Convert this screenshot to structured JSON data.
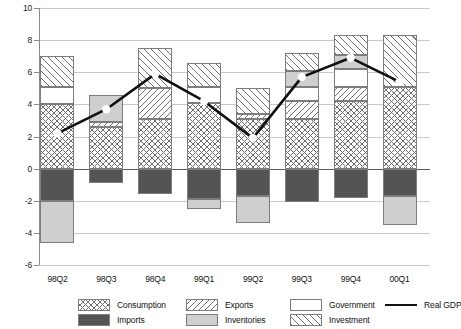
{
  "chart_data": {
    "type": "bar",
    "subtype": "stacked-bar-with-line-overlay",
    "title": "",
    "xlabel": "",
    "ylabel": "",
    "ylim": [
      -6,
      10
    ],
    "yticks": [
      -6,
      -4,
      -2,
      0,
      2,
      4,
      6,
      8,
      10
    ],
    "ytick_labels": [
      "-6",
      "-4",
      "-2",
      "0",
      "2",
      "4",
      "6",
      "8",
      "10"
    ],
    "grid": true,
    "legend_position": "bottom",
    "categories": [
      "98Q2",
      "98Q3",
      "98Q4",
      "99Q1",
      "99Q2",
      "99Q3",
      "99Q4",
      "00Q1"
    ],
    "series": [
      {
        "name": "Consumption",
        "pattern": "cross-hatch",
        "values": [
          4.0,
          2.6,
          3.1,
          4.1,
          3.1,
          3.1,
          4.2,
          5.1
        ]
      },
      {
        "name": "Exports",
        "pattern": "diagonal-backslash",
        "values": [
          0.0,
          0.3,
          1.9,
          0.0,
          0.3,
          1.1,
          0.9,
          0.0
        ]
      },
      {
        "name": "Government",
        "pattern": "blank-white",
        "values": [
          1.1,
          0.0,
          0.0,
          1.0,
          0.0,
          0.9,
          1.1,
          0.0
        ]
      },
      {
        "name": "Inventories",
        "pattern": "solid-light-gray",
        "values": [
          -2.6,
          1.7,
          0.0,
          -0.6,
          -1.7,
          1.0,
          0.9,
          -1.8
        ]
      },
      {
        "name": "Investment",
        "pattern": "diagonal-slash",
        "values": [
          1.9,
          0.0,
          2.5,
          1.5,
          1.6,
          1.1,
          1.2,
          3.2
        ]
      },
      {
        "name": "Imports",
        "pattern": "solid-dark-gray",
        "values": [
          -2.0,
          -0.9,
          -1.6,
          -1.9,
          -1.7,
          -2.1,
          -1.8,
          -1.7
        ]
      }
    ],
    "line_series": {
      "name": "Real GDP",
      "marker": "open-circle",
      "color": "#111111",
      "values": [
        2.2,
        3.7,
        5.9,
        4.2,
        1.9,
        5.7,
        6.9,
        5.4
      ]
    }
  },
  "legend": {
    "items": [
      {
        "label": "Consumption",
        "swatch": "cross-hatch-swatch"
      },
      {
        "label": "Imports",
        "swatch": "dark-gray-swatch"
      },
      {
        "label": "Exports",
        "swatch": "backslash-hatch-swatch"
      },
      {
        "label": "Inventories",
        "swatch": "light-gray-swatch"
      },
      {
        "label": "Government",
        "swatch": "white-swatch"
      },
      {
        "label": "Investment",
        "swatch": "slash-hatch-swatch"
      },
      {
        "label": "Real GDP",
        "swatch": "black-line-swatch"
      }
    ]
  },
  "colors": {
    "hatch": "#6f6f6f",
    "imports": "#545454",
    "inventories": "#cfcfcf",
    "gdp_line": "#111111",
    "gridline": "#c9c9c9",
    "zero_line": "#5a5a5a",
    "bar_border": "#7d7d7d"
  }
}
